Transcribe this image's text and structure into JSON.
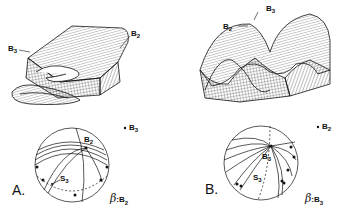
{
  "figure": {
    "panels": [
      {
        "id": "A",
        "label": "A.",
        "block_labels": {
          "upper_right": "B",
          "upper_right_sub": "2",
          "left": "B",
          "left_sub": "3"
        },
        "stereonet": {
          "pole_label": "B",
          "pole_sub": "2",
          "s_label": "S",
          "s_sub": "3",
          "legend_point": "B",
          "legend_point_sub": "3",
          "legend_beta": "β",
          "legend_beta_eq": ":",
          "legend_beta_val": "B",
          "legend_beta_sub": "2"
        }
      },
      {
        "id": "B",
        "label": "B.",
        "block_labels": {
          "top": "B",
          "top_sub": "3",
          "left": "B",
          "left_sub": "2"
        },
        "stereonet": {
          "pole_label": "B",
          "pole_sub": "3",
          "s_label": "S",
          "s_sub": "3",
          "legend_point": "B",
          "legend_point_sub": "2",
          "legend_beta": "β",
          "legend_beta_eq": ":",
          "legend_beta_val": "B",
          "legend_beta_sub": "3"
        }
      }
    ]
  }
}
